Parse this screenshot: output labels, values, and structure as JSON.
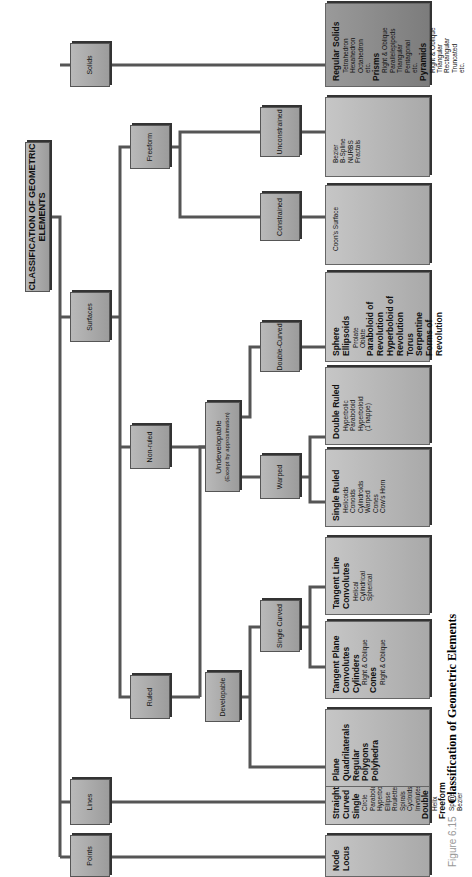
{
  "title": "CLASSIFICATION OF GEOMETRIC ELEMENTS",
  "caption": {
    "figure": "Figure 6.15",
    "text": "Classification of Geometric Elements"
  },
  "level1": [
    "Points",
    "Lines",
    "Surfaces",
    "Solids"
  ],
  "level2": [
    "Ruled",
    "Non-ruled",
    "Freeform"
  ],
  "level3": {
    "developable": "Developable",
    "undevelopable": "Undevelopable",
    "undevelopable_note": "(Except by approximation)"
  },
  "level4": [
    "Single Curved",
    "Warped",
    "Double-Curved",
    "Constrained",
    "Unconstrained"
  ],
  "leaves": [
    {
      "lines": [
        {
          "t": "Node",
          "b": true
        },
        {
          "t": "Locus",
          "b": true
        }
      ]
    },
    {
      "lines": [
        {
          "t": "Straight",
          "b": true
        },
        {
          "t": "Curved",
          "b": true
        },
        {
          "t": "Single",
          "b": true
        },
        {
          "t": "Circle"
        },
        {
          "t": "Parabola"
        },
        {
          "t": "Hyperbola"
        },
        {
          "t": "Ellipse"
        },
        {
          "t": "Roulettes"
        },
        {
          "t": "Spirals"
        },
        {
          "t": "Cycloids"
        },
        {
          "t": "Involutes"
        },
        {
          "t": "Double",
          "b": true
        },
        {
          "t": "Helix"
        },
        {
          "t": "Freeform",
          "b": true
        },
        {
          "t": "Spline"
        },
        {
          "t": "Bezier"
        }
      ],
      "brace": "Conics"
    },
    {
      "lines": [
        {
          "t": "Plane",
          "b": true
        },
        {
          "t": "Quadrilaterals",
          "b": true
        },
        {
          "t": "Regular",
          "b": true
        },
        {
          "t": "Polygons",
          "b": true
        },
        {
          "t": "Polyhedra",
          "b": true
        }
      ]
    },
    {
      "lines": [
        {
          "t": "Tangent Plane",
          "b": true
        },
        {
          "t": "Convolutes",
          "b": true
        },
        {
          "t": "Cylinders",
          "b": true
        },
        {
          "t": "Right & Oblique"
        },
        {
          "t": "Cones",
          "b": true
        },
        {
          "t": "Right & Oblique"
        }
      ]
    },
    {
      "lines": [
        {
          "t": "Tangent Line",
          "b": true
        },
        {
          "t": "Convolutes",
          "b": true
        },
        {
          "t": "Helical"
        },
        {
          "t": "Cylindrical"
        },
        {
          "t": "Spherical"
        }
      ]
    },
    {
      "lines": [
        {
          "t": "Single Ruled",
          "b": true
        },
        {
          "t": "Helicoids"
        },
        {
          "t": "Conoids"
        },
        {
          "t": "Cylindroids"
        },
        {
          "t": "Warped"
        },
        {
          "t": "Cones"
        },
        {
          "t": "Cow's Horn"
        }
      ]
    },
    {
      "lines": [
        {
          "t": "Double Ruled",
          "b": true
        },
        {
          "t": "Hyperbolic"
        },
        {
          "t": "Paraboloid"
        },
        {
          "t": "Hyperboloid"
        },
        {
          "t": "(1 nappe)"
        }
      ]
    },
    {
      "lines": [
        {
          "t": "Sphere",
          "b": true
        },
        {
          "t": "Ellipsoids",
          "b": true
        },
        {
          "t": "Prolate"
        },
        {
          "t": "Oblate"
        },
        {
          "t": "Paraboloid of",
          "b": true
        },
        {
          "t": "Revolution",
          "b": true
        },
        {
          "t": "Hyperboloid of",
          "b": true
        },
        {
          "t": "Revolution",
          "b": true
        },
        {
          "t": "Torus",
          "b": true
        },
        {
          "t": "Serpentine",
          "b": true
        },
        {
          "t": "Forms of",
          "b": true
        },
        {
          "t": "Revolution",
          "b": true
        }
      ]
    },
    {
      "lines": [
        {
          "t": "Coon's Surface"
        }
      ]
    },
    {
      "lines": [
        {
          "t": "Bezier"
        },
        {
          "t": "B-Spline"
        },
        {
          "t": "NURBS"
        },
        {
          "t": "Fractals"
        }
      ]
    },
    {
      "lines": [
        {
          "t": "Regular Solids",
          "b": true
        },
        {
          "t": "Tetrahedron"
        },
        {
          "t": "Hexahedron"
        },
        {
          "t": "Octahedron"
        },
        {
          "t": "etc."
        },
        {
          "t": "Prisms",
          "b": true
        },
        {
          "t": "Right & Oblique"
        },
        {
          "t": "Parallelepipeds"
        },
        {
          "t": "Triangular"
        },
        {
          "t": "Pentagonal"
        },
        {
          "t": "etc."
        },
        {
          "t": "Pyramids",
          "b": true
        },
        {
          "t": "Right & Oblique"
        },
        {
          "t": "Triangular"
        },
        {
          "t": "Rectangular"
        },
        {
          "t": "Truncated"
        },
        {
          "t": "etc."
        }
      ],
      "dark": true
    }
  ]
}
